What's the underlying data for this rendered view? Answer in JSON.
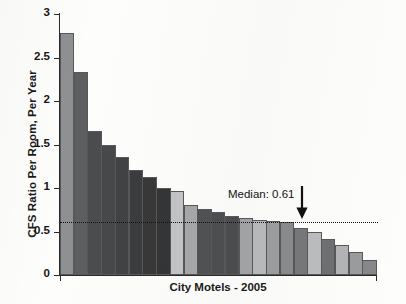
{
  "chart_data": {
    "type": "bar",
    "title": "",
    "xlabel": "City Motels - 2005",
    "ylabel": "CFS Ratio Per Room, Per Year",
    "ylim": [
      0,
      3
    ],
    "yticks": [
      0,
      0.5,
      1,
      1.5,
      2,
      2.5,
      3
    ],
    "ytick_labels": [
      "0",
      "0.5",
      "1",
      "1.5",
      "2",
      "2.5",
      "3"
    ],
    "grid": false,
    "legend": null,
    "categories": [
      "1",
      "2",
      "3",
      "4",
      "5",
      "6",
      "7",
      "8",
      "9",
      "10",
      "11",
      "12",
      "13",
      "14",
      "15",
      "16",
      "17",
      "18",
      "19",
      "20",
      "21",
      "22",
      "23"
    ],
    "values": [
      2.78,
      2.33,
      1.66,
      1.49,
      1.36,
      1.21,
      1.13,
      1.0,
      0.97,
      0.81,
      0.76,
      0.72,
      0.68,
      0.65,
      0.63,
      0.62,
      0.61,
      0.54,
      0.5,
      0.41,
      0.34,
      0.27,
      0.17
    ],
    "bar_colors": [
      "#8f9092",
      "#5d5e60",
      "#4b4c4e",
      "#474849",
      "#414243",
      "#3b3c3d",
      "#383839",
      "#343536",
      "#c3c4c5",
      "#a7a8aa",
      "#515254",
      "#4e4f50",
      "#4c4d4e",
      "#a3a4a6",
      "#b9babb",
      "#9d9e9f",
      "#8a8b8c",
      "#77787a",
      "#bcbdbe",
      "#6f7072",
      "#b3b4b5",
      "#9b9c9d",
      "#87888a"
    ],
    "annotations": [
      {
        "text": "Median: 0.61",
        "value": 0.61,
        "type": "arrow-down"
      }
    ],
    "median": 0.61,
    "median_line_style": "dotted",
    "median_line_color": "#111111"
  }
}
